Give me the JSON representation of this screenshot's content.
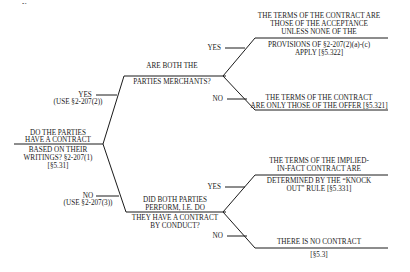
{
  "top_fragment": "y p",
  "root": {
    "question_above": [
      "DO THE PARTIES",
      "HAVE A CONTRACT"
    ],
    "question_below": [
      "BASED ON THEIR",
      "WRITINGS? §2-207(1)",
      "[§5.31]"
    ]
  },
  "branches": {
    "yes": {
      "label": "YES",
      "sublabel": "(USE §2-207(2))"
    },
    "no": {
      "label": "NO",
      "sublabel": "(USE §2-207(3))"
    }
  },
  "upper_node": {
    "question_above": [
      "ARE BOTH THE",
      "PARTIES MERCHANTS?"
    ],
    "yes_label": "YES",
    "no_label": "NO",
    "yes_outcome_above": [
      "THE TERMS OF THE CONTRACT ARE",
      "THOSE OF THE ACCEPTANCE",
      "UNLESS NONE OF THE"
    ],
    "yes_outcome_below": [
      "PROVISIONS OF §2-207(2)(a)-(c)",
      "APPLY [§5.322]"
    ],
    "no_outcome_above": [
      "THE TERMS OF THE CONTRACT",
      "ARE ONLY THOSE OF THE OFFER [§5.321]"
    ]
  },
  "lower_node": {
    "question_above": [
      "DID BOTH PARTIES",
      "PERFORM, I.E. DO"
    ],
    "question_below": [
      "THEY HAVE A CONTRACT",
      "BY CONDUCT?"
    ],
    "yes_label": "YES",
    "no_label": "NO",
    "yes_outcome_above": [
      "THE TERMS OF THE IMPLIED-",
      "IN-FACT CONTRACT ARE"
    ],
    "yes_outcome_below": [
      "DETERMINED BY THE “KNOCK",
      "OUT” RULE [§5.331]"
    ],
    "no_outcome_above": [
      "THERE IS NO CONTRACT"
    ],
    "no_outcome_below": [
      "[§5.3]"
    ]
  }
}
